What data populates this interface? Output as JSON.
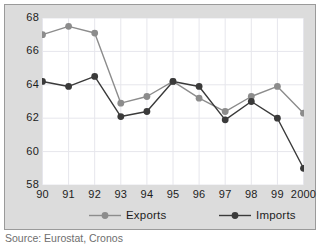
{
  "chart_data": {
    "type": "line",
    "title": "",
    "subtitle": "",
    "xlabel": "",
    "ylabel": "",
    "categories": [
      "90",
      "91",
      "92",
      "93",
      "94",
      "95",
      "96",
      "97",
      "98",
      "99",
      "2000"
    ],
    "x": [
      1990,
      1991,
      1992,
      1993,
      1994,
      1995,
      1996,
      1997,
      1998,
      1999,
      2000
    ],
    "ylim": [
      58,
      68
    ],
    "xlim": [
      1990,
      2000
    ],
    "yticks": [
      58,
      60,
      62,
      64,
      66,
      68
    ],
    "ytick_labels": [
      "58",
      "60",
      "62",
      "64",
      "66",
      "68"
    ],
    "grid": true,
    "grid_axis": "both",
    "legend_position": "bottom",
    "series": [
      {
        "name": "Exports",
        "color": "#8c8c8c",
        "marker": "circle",
        "values": [
          67.0,
          67.5,
          67.1,
          62.9,
          63.3,
          64.2,
          63.2,
          62.4,
          63.3,
          63.9,
          62.3
        ]
      },
      {
        "name": "Imports",
        "color": "#3a3a3a",
        "marker": "circle",
        "values": [
          64.2,
          63.9,
          64.5,
          62.1,
          62.4,
          64.2,
          63.9,
          61.9,
          63.0,
          62.0,
          59.0
        ]
      }
    ],
    "annotations": []
  },
  "axes": {
    "y_ticks": [
      {
        "label": "68",
        "value": 68
      },
      {
        "label": "66",
        "value": 66
      },
      {
        "label": "64",
        "value": 64
      },
      {
        "label": "62",
        "value": 62
      },
      {
        "label": "60",
        "value": 60
      },
      {
        "label": "58",
        "value": 58
      }
    ],
    "x_ticks": [
      {
        "label": "90",
        "value": 1990
      },
      {
        "label": "91",
        "value": 1991
      },
      {
        "label": "92",
        "value": 1992
      },
      {
        "label": "93",
        "value": 1993
      },
      {
        "label": "94",
        "value": 1994
      },
      {
        "label": "95",
        "value": 1995
      },
      {
        "label": "96",
        "value": 1996
      },
      {
        "label": "97",
        "value": 1997
      },
      {
        "label": "98",
        "value": 1998
      },
      {
        "label": "99",
        "value": 1999
      },
      {
        "label": "2000",
        "value": 2000
      }
    ]
  },
  "legend": {
    "entries": [
      {
        "label": "Exports",
        "color": "#8c8c8c"
      },
      {
        "label": "Imports",
        "color": "#3a3a3a"
      }
    ]
  },
  "source": {
    "text": "Source: Eurostat, Cronos"
  },
  "colors": {
    "exports": "#8c8c8c",
    "imports": "#3a3a3a",
    "frame_background": "#dcdcdc",
    "plot_background": "#ffffff",
    "gridline": "#e6e6ec",
    "text": "#1c1c1c"
  }
}
